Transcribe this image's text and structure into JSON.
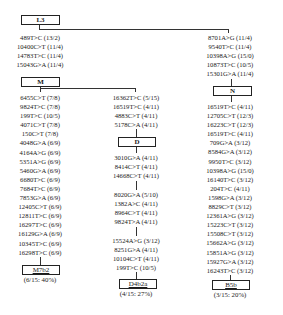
{
  "tree": {
    "root": {
      "label": "L3"
    },
    "m_branch": {
      "mutations_to_M": [
        "489T>C (13/2)",
        "10400C>T (11/4)",
        "14783T>C (11/4)",
        "15043G>A (11/4)"
      ],
      "node": {
        "label": "M"
      },
      "m7b2": {
        "mutations": [
          "6455C>T (7/8)",
          "9824T>C (7/8)",
          "199T>C (10/5)",
          "4071C>T (7/8)",
          "150C>T (7/8)",
          "4048G>A (6/9)",
          "4164A>G (6/9)",
          "5351A>G (6/9)",
          "5460G>A (6/9)",
          "6680T>C (6/9)",
          "7684T>C (6/9)",
          "7853G>A (6/9)",
          "12405C>T (6/9)",
          "12811T>C (6/9)",
          "16297T>C (6/9)",
          "16129G>A (6/9)",
          "10345T>C (6/9)",
          "16298T>C (6/9)"
        ],
        "label": "M7b2",
        "frequency": "(6/15: 40%)"
      },
      "d_branch": {
        "mutations_to_D": [
          "16362T>C (5/15)",
          "16519T>C (4/11)",
          "4883C>T (4/11)",
          "5178C>A (4/11)"
        ],
        "node": {
          "label": "D"
        },
        "mutations_group1": [
          "3010G>A (4/11)",
          "8414C>T (4/11)",
          "14668C>T (4/11)"
        ],
        "mutations_group2": [
          "8020G>A (5/10)",
          "1382A>C (4/11)",
          "8964C>T (4/11)",
          "9824T>A (4/11)"
        ],
        "mutations_group3": [
          "15524A>G (3/12)",
          "8251G>A (4/11)",
          "10104C>T (4/11)",
          "199T>C (10/5)"
        ],
        "label": "D4b2a",
        "frequency": "(4/15: 27%)"
      }
    },
    "n_branch": {
      "mutations_to_N": [
        "8701A>G (11/4)",
        "9540T>C (11/4)",
        "10398A>G (15/0)",
        "10873T>C (10/5)",
        "15301G>A (11/4)"
      ],
      "node": {
        "label": "N"
      },
      "b5b": {
        "mutations": [
          "16519T>C (4/11)",
          "12705C>T (12/3)",
          "16223C>T (12/3)",
          "16519T>C (4/11)",
          "709G>A (3/12)",
          "8584G>A (3/12)",
          "9950T>C (3/12)",
          "10398A>G (15/0)",
          "16140T>C (3/12)",
          "204T>C (4/11)",
          "1598G>A (3/12)",
          "8829C>T (3/12)",
          "12361A>G (3/12)",
          "15223C>T (3/12)",
          "15508C>T (3/12)",
          "15662A>G (3/12)",
          "15851A>G (3/12)",
          "15927G>A (3/12)",
          "16243T>C (3/12)"
        ],
        "label": "B5b",
        "frequency": "(3/15: 20%)"
      }
    }
  }
}
